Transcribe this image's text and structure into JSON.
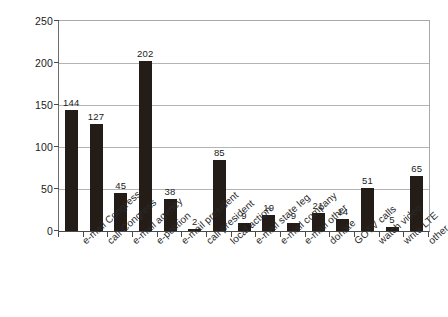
{
  "chart_data": {
    "type": "bar",
    "title": "",
    "subtitle": "",
    "xlabel": "",
    "ylabel": "",
    "ylim": [
      0,
      250
    ],
    "ytick_interval": 50,
    "ytick_labels": [
      "0",
      "50",
      "100",
      "150",
      "200",
      "250"
    ],
    "ytick_values": [
      0,
      50,
      100,
      150,
      200,
      250
    ],
    "grid": true,
    "legend": null,
    "bar_color": "#241c17",
    "grid_color": "#b4b4b4",
    "axis_color": "#4a4a4a",
    "background": "#ffffff",
    "show_value_labels": true,
    "xtick_label_rotation": -42,
    "categories": [
      "e-mail Congress",
      "call Congress",
      "e-mail agency",
      "e-petition",
      "e-mail president",
      "call president",
      "local action",
      "e-mail state leg",
      "e-mail company",
      "e-mail other",
      "donate",
      "GOTV calls",
      "watch video",
      "write LTE",
      "other"
    ],
    "values": [
      144,
      127,
      45,
      202,
      38,
      2,
      85,
      9,
      19,
      9,
      21,
      14,
      51,
      5,
      65
    ]
  }
}
